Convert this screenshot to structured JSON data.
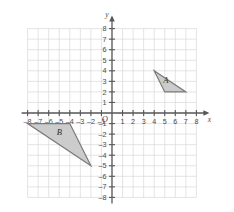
{
  "chart_data": {
    "type": "scatter",
    "title": "",
    "xlabel": "x",
    "ylabel": "y",
    "origin_label": "O",
    "grid": true,
    "xlim": [
      -8,
      8
    ],
    "ylim": [
      -8,
      8
    ],
    "x_ticks": [
      -8,
      -7,
      -6,
      -5,
      -4,
      -3,
      -2,
      -1,
      1,
      2,
      3,
      4,
      5,
      6,
      7,
      8
    ],
    "y_ticks": [
      -8,
      -7,
      -6,
      -5,
      -4,
      -3,
      -2,
      -1,
      1,
      2,
      3,
      4,
      5,
      6,
      7,
      8
    ],
    "x_tick_labels": [
      "-8",
      "-7",
      "-6",
      "-5",
      "-4",
      "-3",
      "-2",
      "-1",
      "1",
      "2",
      "3",
      "4",
      "5",
      "6",
      "7",
      "8"
    ],
    "y_tick_labels": [
      "-8",
      "-7",
      "-6",
      "-5",
      "-4",
      "-3",
      "-2",
      "-1",
      "1",
      "2",
      "3",
      "4",
      "5",
      "6",
      "7",
      "8"
    ],
    "shapes": [
      {
        "label": "A",
        "kind": "triangle",
        "vertices": [
          [
            4,
            4
          ],
          [
            7,
            2
          ],
          [
            5,
            2
          ]
        ],
        "label_at": [
          5.1,
          2.85
        ],
        "fill": "#c9c9c9",
        "stroke": "#7a7a7c"
      },
      {
        "label": "B",
        "kind": "triangle",
        "vertices": [
          [
            -8,
            -1
          ],
          [
            -4,
            -1
          ],
          [
            -2,
            -5
          ]
        ],
        "label_at": [
          -5.0,
          -2.1
        ],
        "fill": "#c9c9c9",
        "stroke": "#7a7a7c"
      }
    ],
    "colors": {
      "grid": "#d9d9d9",
      "axis": "#58585a",
      "shape_fill": "#c9c9c9",
      "shape_stroke": "#7a7a7c",
      "background": "#ffffff"
    }
  }
}
